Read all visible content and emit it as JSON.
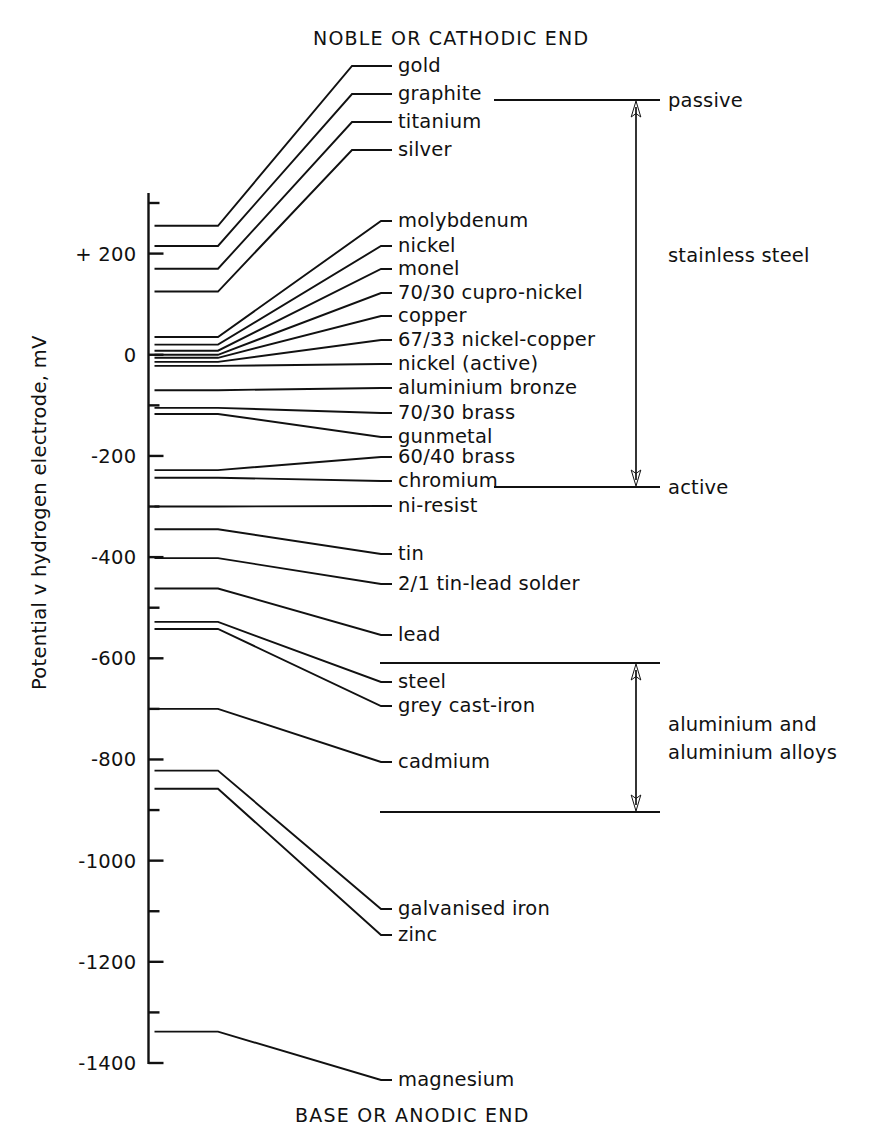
{
  "chart_data": {
    "type": "line",
    "top_header": "NOBLE OR CATHODIC END",
    "bottom_header": "BASE OR ANODIC END",
    "ylabel": "Potential v hydrogen electrode,  mV",
    "xlabel": "",
    "ylim": [
      -1450,
      340
    ],
    "grid": false,
    "legend_position": "none",
    "y_ticks_major": [
      200,
      0,
      -200,
      -400,
      -600,
      -800,
      -1000,
      -1200,
      -1400
    ],
    "y_tick_labels": [
      "+ 200",
      "0",
      "-200",
      "-400",
      "-600",
      "-800",
      "-1000",
      "-1200",
      "-1400"
    ],
    "y_ticks_minor": [
      300,
      -100,
      -300,
      -500,
      -700,
      -900,
      -1100,
      -1300
    ],
    "units": "mV",
    "series": [
      {
        "name": "gold",
        "potential_mv": 255
      },
      {
        "name": "graphite",
        "potential_mv": 215
      },
      {
        "name": "titanium",
        "potential_mv": 170
      },
      {
        "name": "silver",
        "potential_mv": 125
      },
      {
        "name": "molybdenum",
        "potential_mv": 35
      },
      {
        "name": "nickel",
        "potential_mv": 20
      },
      {
        "name": "monel",
        "potential_mv": 8
      },
      {
        "name": "70/30 cupro-nickel",
        "potential_mv": 0
      },
      {
        "name": "copper",
        "potential_mv": -6
      },
      {
        "name": "67/33 nickel-copper",
        "potential_mv": -14
      },
      {
        "name": "nickel (active)",
        "potential_mv": -22
      },
      {
        "name": "aluminium bronze",
        "potential_mv": -70
      },
      {
        "name": "70/30 brass",
        "potential_mv": -105
      },
      {
        "name": "gunmetal",
        "potential_mv": -117
      },
      {
        "name": "60/40 brass",
        "potential_mv": -228
      },
      {
        "name": "chromium",
        "potential_mv": -243
      },
      {
        "name": "ni-resist",
        "potential_mv": -300
      },
      {
        "name": "tin",
        "potential_mv": -345
      },
      {
        "name": "2/1 tin-lead solder",
        "potential_mv": -402
      },
      {
        "name": "lead",
        "potential_mv": -462
      },
      {
        "name": "steel",
        "potential_mv": -528
      },
      {
        "name": "grey cast-iron",
        "potential_mv": -542
      },
      {
        "name": "cadmium",
        "potential_mv": -700
      },
      {
        "name": "galvanised iron",
        "potential_mv": -822
      },
      {
        "name": "zinc",
        "potential_mv": -858
      },
      {
        "name": "magnesium",
        "potential_mv": -1338
      }
    ],
    "annotations": [
      {
        "label": "passive",
        "kind": "bracket-end-top"
      },
      {
        "label": "stainless steel",
        "kind": "bracket-range-label"
      },
      {
        "label": "active",
        "kind": "bracket-end-bottom"
      },
      {
        "label": "aluminium and",
        "kind": "bracket-range-label"
      },
      {
        "label": "aluminium alloys",
        "kind": "bracket-range-label"
      }
    ]
  },
  "header": {
    "top": "NOBLE OR CATHODIC END",
    "bottom": "BASE OR ANODIC END"
  },
  "axis": {
    "title": "Potential v hydrogen electrode,  mV",
    "ticks": [
      {
        "label": "+ 200"
      },
      {
        "label": "0"
      },
      {
        "label": "-200"
      },
      {
        "label": "-400"
      },
      {
        "label": "-600"
      },
      {
        "label": "-800"
      },
      {
        "label": "-1000"
      },
      {
        "label": "-1200"
      },
      {
        "label": "-1400"
      }
    ]
  },
  "materials": [
    {
      "label": "gold"
    },
    {
      "label": "graphite"
    },
    {
      "label": "titanium"
    },
    {
      "label": "silver"
    },
    {
      "label": "molybdenum"
    },
    {
      "label": "nickel"
    },
    {
      "label": "monel"
    },
    {
      "label": "70/30 cupro-nickel"
    },
    {
      "label": "copper"
    },
    {
      "label": "67/33 nickel-copper"
    },
    {
      "label": "nickel (active)"
    },
    {
      "label": "aluminium bronze"
    },
    {
      "label": "70/30 brass"
    },
    {
      "label": "gunmetal"
    },
    {
      "label": "60/40 brass"
    },
    {
      "label": "chromium"
    },
    {
      "label": "ni-resist"
    },
    {
      "label": "tin"
    },
    {
      "label": "2/1 tin-lead solder"
    },
    {
      "label": "lead"
    },
    {
      "label": "steel"
    },
    {
      "label": "grey cast-iron"
    },
    {
      "label": "cadmium"
    },
    {
      "label": "galvanised iron"
    },
    {
      "label": "zinc"
    },
    {
      "label": "magnesium"
    }
  ],
  "annotations": {
    "passive": "passive",
    "stainless_steel": "stainless steel",
    "active": "active",
    "aluminium_line1": "aluminium and",
    "aluminium_line2": "aluminium alloys"
  },
  "colors": {
    "ink": "#111111",
    "background": "#ffffff"
  }
}
